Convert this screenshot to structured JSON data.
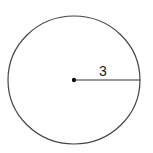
{
  "diagram": {
    "shape": "circle",
    "center": {
      "x": 74,
      "y": 80
    },
    "radius_px": {
      "rx": 66,
      "ry": 64
    },
    "radius_label": "3",
    "stroke_color": "#333333",
    "background": "#ffffff"
  }
}
